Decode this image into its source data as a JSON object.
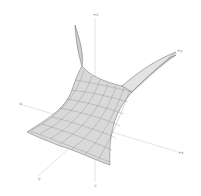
{
  "figure": {
    "type": "3d-surface-plot",
    "surface_color": "#d8d8d8",
    "mesh_color": "#555555",
    "axis_color": "#cccccc"
  },
  "axes": {
    "z_pos": "+z",
    "z_neg": "-z",
    "y_pos": "+y",
    "y_neg": "-y",
    "x_pos": "+x",
    "x_neg": "-x"
  }
}
